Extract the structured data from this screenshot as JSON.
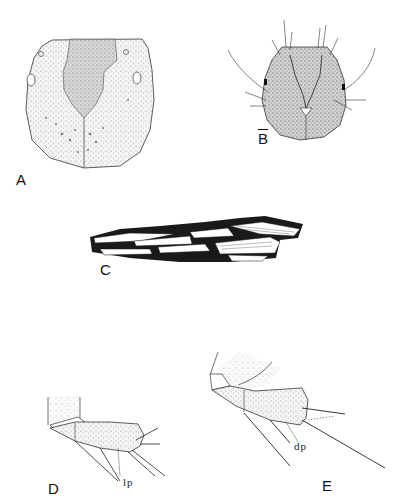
{
  "plate": {
    "panels": [
      {
        "id": "A",
        "label": "A",
        "subject": "head capsule, dorsal view"
      },
      {
        "id": "B",
        "label": "B",
        "label_overbar": true,
        "subject": "head capsule with setae, dorsal view"
      },
      {
        "id": "C",
        "label": "C",
        "subject": "larval case of plant fragments"
      },
      {
        "id": "D",
        "label": "D",
        "subject": "anal proleg, lateral",
        "annotation": "lp"
      },
      {
        "id": "E",
        "label": "E",
        "subject": "anal proleg, lateral",
        "annotation": "dp"
      }
    ],
    "colors": {
      "ink": "#1a1a1a",
      "stipple": "#b8b8b8",
      "background": "#ffffff"
    }
  }
}
